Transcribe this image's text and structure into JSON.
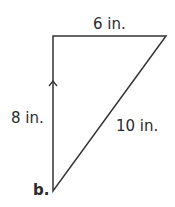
{
  "figure": {
    "label": "b.",
    "shape": "right triangle",
    "sides": {
      "top": "6 in.",
      "left": "8 in.",
      "hypotenuse": "10 in."
    },
    "markers": [
      "arrow-up-icon on left side"
    ],
    "line_color": "#333333"
  }
}
